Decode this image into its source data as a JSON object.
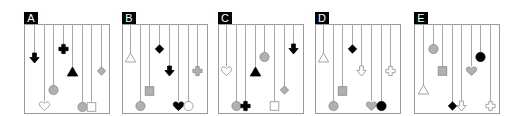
{
  "figure": {
    "width": 524,
    "height": 116,
    "colors": {
      "frame": "#9a9a9a",
      "string": "#a8a8a8",
      "black": "#000000",
      "gray_fill": "#b0b0b0",
      "gray_stroke": "#8a8a8a",
      "outline_stroke": "#9a9a9a",
      "label_bg": "#000000",
      "label_text": "#ffffff"
    },
    "frame_top": 24,
    "frame_bottom": 113,
    "panel_width": 85,
    "label_height": 12,
    "label_width": 14
  },
  "panels": [
    {
      "label": "A",
      "x": 24,
      "items": [
        {
          "dx": 10,
          "y": 58,
          "shape": "arrow-down",
          "style": "black"
        },
        {
          "dx": 20,
          "y": 106,
          "shape": "heart",
          "style": "outline"
        },
        {
          "dx": 29,
          "y": 90,
          "shape": "circle",
          "style": "gray"
        },
        {
          "dx": 39,
          "y": 49,
          "shape": "plus",
          "style": "black"
        },
        {
          "dx": 48,
          "y": 72,
          "shape": "triangle",
          "style": "black"
        },
        {
          "dx": 58,
          "y": 107,
          "shape": "circle",
          "style": "gray"
        },
        {
          "dx": 67,
          "y": 107,
          "shape": "square",
          "style": "outline"
        },
        {
          "dx": 77,
          "y": 71,
          "shape": "diamond",
          "style": "gray"
        }
      ]
    },
    {
      "label": "B",
      "x": 122,
      "items": [
        {
          "dx": 8,
          "y": 58,
          "shape": "triangle",
          "style": "outline"
        },
        {
          "dx": 18,
          "y": 106,
          "shape": "circle",
          "style": "gray"
        },
        {
          "dx": 27,
          "y": 91,
          "shape": "square",
          "style": "gray"
        },
        {
          "dx": 37,
          "y": 49,
          "shape": "diamond",
          "style": "black"
        },
        {
          "dx": 47,
          "y": 71,
          "shape": "arrow-down",
          "style": "black"
        },
        {
          "dx": 56,
          "y": 106,
          "shape": "heart",
          "style": "black"
        },
        {
          "dx": 66,
          "y": 106,
          "shape": "circle",
          "style": "outline"
        },
        {
          "dx": 75,
          "y": 71,
          "shape": "plus",
          "style": "gray"
        }
      ]
    },
    {
      "label": "C",
      "x": 218,
      "items": [
        {
          "dx": 8,
          "y": 71,
          "shape": "heart",
          "style": "outline"
        },
        {
          "dx": 18,
          "y": 106,
          "shape": "circle",
          "style": "gray"
        },
        {
          "dx": 27,
          "y": 106,
          "shape": "plus",
          "style": "black"
        },
        {
          "dx": 37,
          "y": 72,
          "shape": "triangle",
          "style": "black"
        },
        {
          "dx": 46,
          "y": 57,
          "shape": "circle",
          "style": "gray"
        },
        {
          "dx": 56,
          "y": 106,
          "shape": "square",
          "style": "outline"
        },
        {
          "dx": 66,
          "y": 90,
          "shape": "diamond",
          "style": "gray"
        },
        {
          "dx": 75,
          "y": 49,
          "shape": "arrow-down",
          "style": "black"
        }
      ]
    },
    {
      "label": "D",
      "x": 315,
      "items": [
        {
          "dx": 8,
          "y": 58,
          "shape": "triangle",
          "style": "outline"
        },
        {
          "dx": 18,
          "y": 106,
          "shape": "circle",
          "style": "gray"
        },
        {
          "dx": 27,
          "y": 91,
          "shape": "square",
          "style": "gray"
        },
        {
          "dx": 37,
          "y": 49,
          "shape": "diamond",
          "style": "black"
        },
        {
          "dx": 46,
          "y": 71,
          "shape": "arrow-down",
          "style": "outline"
        },
        {
          "dx": 56,
          "y": 106,
          "shape": "heart",
          "style": "gray"
        },
        {
          "dx": 66,
          "y": 106,
          "shape": "circle",
          "style": "black"
        },
        {
          "dx": 75,
          "y": 71,
          "shape": "plus",
          "style": "outline"
        }
      ]
    },
    {
      "label": "E",
      "x": 414,
      "items": [
        {
          "dx": 9,
          "y": 90,
          "shape": "triangle",
          "style": "outline"
        },
        {
          "dx": 19,
          "y": 49,
          "shape": "circle",
          "style": "gray"
        },
        {
          "dx": 28,
          "y": 71,
          "shape": "square",
          "style": "gray"
        },
        {
          "dx": 38,
          "y": 106,
          "shape": "diamond",
          "style": "black"
        },
        {
          "dx": 47,
          "y": 106,
          "shape": "arrow-down",
          "style": "outline"
        },
        {
          "dx": 57,
          "y": 71,
          "shape": "heart",
          "style": "gray"
        },
        {
          "dx": 66,
          "y": 57,
          "shape": "circle",
          "style": "black"
        },
        {
          "dx": 76,
          "y": 106,
          "shape": "plus",
          "style": "outline"
        }
      ]
    }
  ]
}
